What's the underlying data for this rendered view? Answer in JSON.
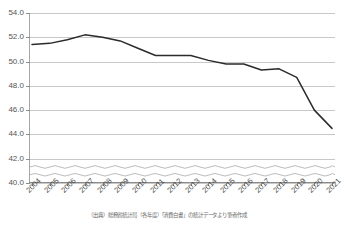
{
  "chart_data": {
    "type": "line",
    "title": "",
    "subtitle": "",
    "xlabel": "",
    "ylabel": "",
    "categories": [
      "2004",
      "2005",
      "2006",
      "2007",
      "2008",
      "2009",
      "2010",
      "2011",
      "2012",
      "2013",
      "2014",
      "2015",
      "2016",
      "2017",
      "2018",
      "2019",
      "2020",
      "2021"
    ],
    "values": [
      51.4,
      51.5,
      51.8,
      52.2,
      52.0,
      51.7,
      51.1,
      50.5,
      50.5,
      50.5,
      50.1,
      49.8,
      49.8,
      49.3,
      49.4,
      48.7,
      46.0,
      44.5
    ],
    "series": [
      {
        "name": "",
        "values": [
          51.4,
          51.5,
          51.8,
          52.2,
          52.0,
          51.7,
          51.1,
          50.5,
          50.5,
          50.5,
          50.1,
          49.8,
          49.8,
          49.3,
          49.4,
          48.7,
          46.0,
          44.5
        ]
      }
    ],
    "ylim": [
      40.0,
      54.0
    ],
    "ytick_values": [
      40.0,
      42.0,
      44.0,
      46.0,
      48.0,
      50.0,
      52.0,
      54.0
    ],
    "ytick_labels": [
      "40.0",
      "42.0",
      "44.0",
      "46.0",
      "48.0",
      "50.0",
      "52.0",
      "54.0"
    ],
    "xtick_labels": [
      "2004",
      "2005",
      "2006",
      "2007",
      "2008",
      "2009",
      "2010",
      "2011",
      "2012",
      "2013",
      "2014",
      "2015",
      "2016",
      "2017",
      "2018",
      "2019",
      "2020",
      "2021"
    ],
    "grid": true,
    "legend": "none",
    "axis_break": {
      "present": true,
      "between": [
        40.0,
        42.0
      ],
      "style": "wavy-double"
    },
    "line_color": "#2b2b2b",
    "grid_color": "#c8c8c8",
    "axis_color": "#8c8c8c",
    "annotations": []
  },
  "caption": {
    "text": "（出典）総務省統計局（各年度）「消費白書」の統計データより筆者作成"
  }
}
